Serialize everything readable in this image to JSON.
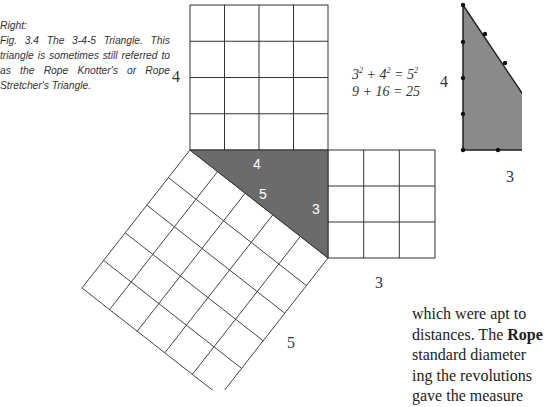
{
  "caption": {
    "heading": "Right:",
    "text": "Fig. 3.4 The 3-4-5 Triangle. This triangle is sometimes still referred to as the Rope Knotter's or Rope Stretcher's Triangle."
  },
  "figure": {
    "top_square_label": "4",
    "right_square_label": "3",
    "hyp_square_label": "5",
    "triangle_labels": {
      "side_a": "4",
      "hypotenuse": "5",
      "side_b": "3"
    },
    "formula": {
      "line1_a": "3",
      "line1_b": "4",
      "line1_c": "5",
      "exp": "2",
      "line2": "9 + 16 = 25"
    },
    "rope_triangle": {
      "height_label": "4",
      "base_label": "3"
    },
    "colors": {
      "triangle_fill": "#6b6b6b",
      "line": "#333333"
    }
  },
  "body_text": {
    "lines": [
      "which were apt to",
      "distances. The ",
      "standard diameter",
      "ing the revolutions",
      "gave the measure"
    ],
    "bold_term": "Rope"
  }
}
